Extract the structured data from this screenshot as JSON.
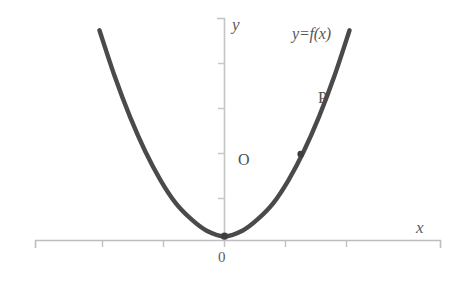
{
  "chart_data": {
    "type": "line",
    "title": "",
    "subtitle": "",
    "xlabel": "x",
    "ylabel": "y",
    "grid": false,
    "legend": "none",
    "curve_label": "y=f(x)",
    "origin_label": "O",
    "x_origin_tick_label": "0",
    "axis_style": {
      "x_axis_tick_direction": "down",
      "y_axis_tick_direction": "left",
      "x_axis_tick_count": 7,
      "y_axis_tick_count": 5
    },
    "series": [
      {
        "name": "y=f(x)",
        "color": "#4a4a4a",
        "points": [
          {
            "x": -4.1,
            "y": 7.3
          },
          {
            "x": -3.6,
            "y": 5.7
          },
          {
            "x": -3.1,
            "y": 4.3
          },
          {
            "x": -2.6,
            "y": 3.1
          },
          {
            "x": -2.1,
            "y": 2.1
          },
          {
            "x": -1.6,
            "y": 1.3
          },
          {
            "x": -1.1,
            "y": 0.75
          },
          {
            "x": -0.6,
            "y": 0.35
          },
          {
            "x": 0.0,
            "y": 0.15
          },
          {
            "x": 0.6,
            "y": 0.35
          },
          {
            "x": 1.1,
            "y": 0.75
          },
          {
            "x": 1.6,
            "y": 1.3
          },
          {
            "x": 2.1,
            "y": 2.1
          },
          {
            "x": 2.6,
            "y": 3.1
          },
          {
            "x": 3.1,
            "y": 4.3
          },
          {
            "x": 3.6,
            "y": 5.7
          },
          {
            "x": 4.1,
            "y": 7.3
          }
        ]
      }
    ],
    "annotations": [
      {
        "name": "P",
        "label": "P",
        "x": 2.5,
        "y": 3.0,
        "marker": "dot",
        "label_position": "left"
      },
      {
        "name": "vertex",
        "label": "O",
        "x": 0.0,
        "y": 0.15,
        "marker": "dot",
        "label_position": "upper-right"
      }
    ],
    "xlim": [
      -5.0,
      6.2
    ],
    "ylim": [
      -1.4,
      7.9
    ]
  },
  "labels": {
    "y_axis": "y",
    "x_axis": "x",
    "curve": "y=f(x)",
    "point_p": "P",
    "point_o": "O",
    "origin_zero": "0"
  },
  "colors": {
    "curve": "#4a4a4a",
    "axis": "#b8b8b8",
    "text": "#545454",
    "background": "#ffffff"
  }
}
